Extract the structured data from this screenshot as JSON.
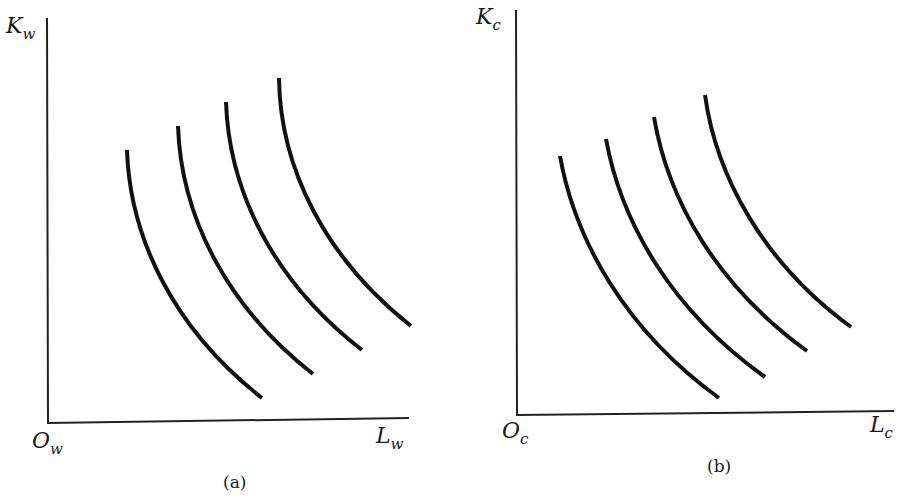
{
  "figure": {
    "panels": [
      {
        "id": "a",
        "caption": "(a)",
        "y_axis_label": {
          "main": "K",
          "sub": "w"
        },
        "x_axis_label": {
          "main": "L",
          "sub": "w"
        },
        "origin_label": {
          "main": "O",
          "sub": "w"
        },
        "isoquant_count": 4
      },
      {
        "id": "b",
        "caption": "(b)",
        "y_axis_label": {
          "main": "K",
          "sub": "c"
        },
        "x_axis_label": {
          "main": "L",
          "sub": "c"
        },
        "origin_label": {
          "main": "O",
          "sub": "c"
        },
        "isoquant_count": 4
      }
    ],
    "colors": {
      "line": "#111111",
      "axis": "#222222",
      "background": "#ffffff"
    }
  }
}
